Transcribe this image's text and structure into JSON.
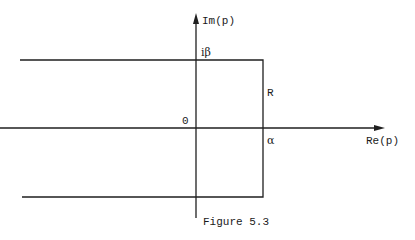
{
  "figure": {
    "caption": "Figure 5.3",
    "axes": {
      "x_label": "Re(p)",
      "y_label": "Im(p)",
      "origin_label": "0"
    },
    "contour": {
      "top_label": "iβ",
      "right_label": "R",
      "intercept_label": "α"
    }
  }
}
